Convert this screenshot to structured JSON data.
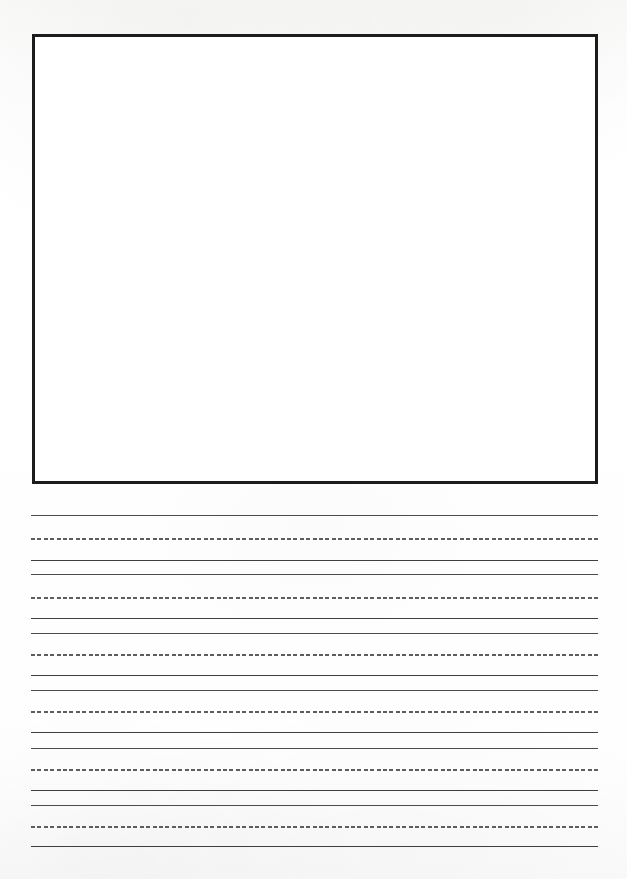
{
  "page": {
    "kind": "handwriting-practice-worksheet",
    "width": 627,
    "height": 879,
    "background_color": "#fdfdfc",
    "title_text": "",
    "instructions_text": ""
  },
  "drawing_box": {
    "name": "drawing-area",
    "label": "",
    "content_text": "",
    "border_color": "#1c1c1c",
    "border_width_px": 3,
    "fill_color": "#ffffff",
    "x": 32,
    "y": 34,
    "width": 566,
    "height": 450
  },
  "writing_area": {
    "left_margin_px": 31,
    "right_margin_px": 598,
    "line_length_px": 567,
    "solid_color": "#4b4b4b",
    "dashed_color": "#5d5d5d",
    "group_count": 6,
    "groups": [
      {
        "top_line_y": 515,
        "midline_y": 538,
        "baseline_y": 560
      },
      {
        "top_line_y": 574,
        "midline_y": 597,
        "baseline_y": 618
      },
      {
        "top_line_y": 633,
        "midline_y": 654,
        "baseline_y": 675
      },
      {
        "top_line_y": 690,
        "midline_y": 711,
        "baseline_y": 732
      },
      {
        "top_line_y": 748,
        "midline_y": 769,
        "baseline_y": 790
      },
      {
        "top_line_y": 805,
        "midline_y": 826,
        "baseline_y": 846
      }
    ],
    "lines": [
      {
        "y": 515,
        "style": "solid",
        "role": "top-line"
      },
      {
        "y": 538,
        "style": "dashed",
        "role": "midline"
      },
      {
        "y": 560,
        "style": "solid",
        "role": "baseline"
      },
      {
        "y": 574,
        "style": "solid",
        "role": "top-line"
      },
      {
        "y": 597,
        "style": "dashed",
        "role": "midline"
      },
      {
        "y": 618,
        "style": "solid",
        "role": "baseline"
      },
      {
        "y": 633,
        "style": "solid",
        "role": "top-line"
      },
      {
        "y": 654,
        "style": "dashed",
        "role": "midline"
      },
      {
        "y": 675,
        "style": "solid",
        "role": "baseline"
      },
      {
        "y": 690,
        "style": "solid",
        "role": "top-line"
      },
      {
        "y": 711,
        "style": "dashed",
        "role": "midline"
      },
      {
        "y": 732,
        "style": "solid",
        "role": "baseline"
      },
      {
        "y": 748,
        "style": "solid",
        "role": "top-line"
      },
      {
        "y": 769,
        "style": "dashed",
        "role": "midline"
      },
      {
        "y": 790,
        "style": "solid",
        "role": "baseline"
      },
      {
        "y": 805,
        "style": "solid",
        "role": "top-line"
      },
      {
        "y": 826,
        "style": "dashed",
        "role": "midline"
      },
      {
        "y": 846,
        "style": "solid",
        "role": "baseline"
      }
    ]
  }
}
